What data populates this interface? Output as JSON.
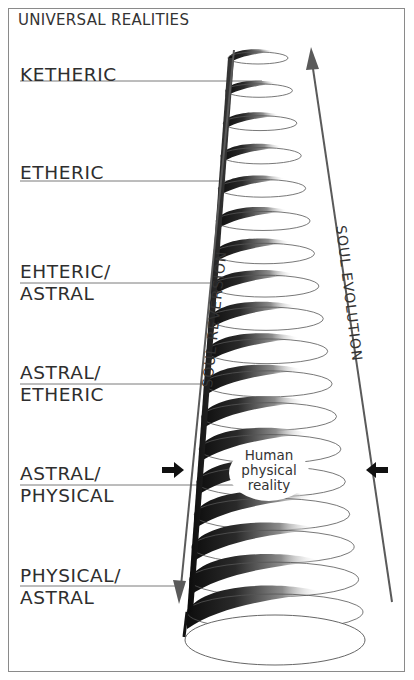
{
  "title": "UNIVERSAL REALITIES",
  "levels": [
    {
      "line1": "KETHERIC",
      "line2": "",
      "y": 64,
      "leader_y": 81,
      "leader_x2": 262
    },
    {
      "line1": "ETHERIC",
      "line2": "",
      "y": 162,
      "leader_y": 181,
      "leader_x2": 238
    },
    {
      "line1": "EHTERIC/",
      "line2": "ASTRAL",
      "y": 261,
      "leader_y": 283,
      "leader_x2": 221
    },
    {
      "line1": "ASTRAL/",
      "line2": "ETHERIC",
      "y": 362,
      "leader_y": 384,
      "leader_x2": 208
    },
    {
      "line1": "ASTRAL/",
      "line2": "PHYSICAL",
      "y": 463,
      "leader_y": 485,
      "leader_x2": 243
    },
    {
      "line1": "PHYSICAL/",
      "line2": "ASTRAL",
      "y": 565,
      "leader_y": 586,
      "leader_x2": 180
    }
  ],
  "arrows": {
    "left_label": "SOUL REVERSION",
    "right_label": "SOUL EVOLUTION",
    "left_direction": "down",
    "right_direction": "up"
  },
  "center_label": [
    "Human",
    "physical",
    "reality"
  ],
  "colors": {
    "frame": "#8a8a8a",
    "text": "#2e2e2e",
    "spiral_dark": "#111111",
    "arrow_line": "#666666"
  }
}
